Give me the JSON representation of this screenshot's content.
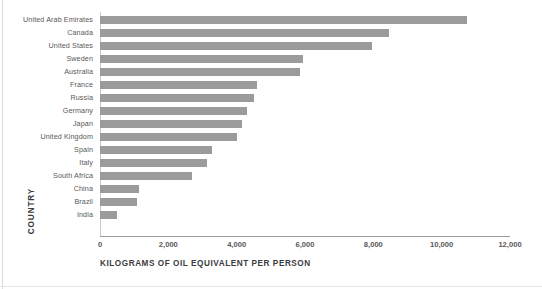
{
  "chart_data": {
    "type": "bar",
    "orientation": "horizontal",
    "title": "",
    "xlabel": "KILOGRAMS OF OIL EQUIVALENT PER PERSON",
    "ylabel": "COUNTRY",
    "categories": [
      "United Arab Emirates",
      "Canada",
      "United States",
      "Sweden",
      "Australia",
      "France",
      "Russia",
      "Germany",
      "Japan",
      "United Kingdom",
      "Spain",
      "Italy",
      "South Africa",
      "China",
      "Brazil",
      "India"
    ],
    "values": [
      10750,
      8450,
      7960,
      5930,
      5850,
      4600,
      4520,
      4310,
      4160,
      4000,
      3280,
      3140,
      2700,
      1150,
      1090,
      510
    ],
    "xlim": [
      0,
      12000
    ],
    "xticks": [
      0,
      2000,
      4000,
      6000,
      8000,
      10000,
      12000
    ],
    "xtick_labels": [
      "0",
      "2,000",
      "4,000",
      "6,000",
      "8,000",
      "10,000",
      "12,000"
    ],
    "grid": false,
    "legend": null,
    "bar_color": "#9b9b9b",
    "text_color": "#58585a",
    "axis_color": "#9b9b9b",
    "background": "#ffffff"
  }
}
